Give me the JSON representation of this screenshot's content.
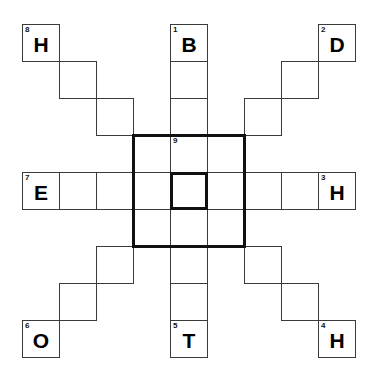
{
  "puzzle": {
    "title": "Crossword grid",
    "grid": {
      "rows": 9,
      "cols": 9,
      "cell_size": 37,
      "origin_x": 22,
      "origin_y": 24
    },
    "colors": {
      "background": "#ffffff",
      "thin_line": "#3a3a3a",
      "bold_line": "#111111",
      "letter": "#000000",
      "number": "#111111"
    },
    "cells": [
      {
        "row": 0,
        "col": 0,
        "number": "8",
        "letter": "H",
        "bold": false
      },
      {
        "row": 0,
        "col": 4,
        "number": "1",
        "letter": "B",
        "bold": false
      },
      {
        "row": 0,
        "col": 8,
        "number": "2",
        "letter": "D",
        "bold": false
      },
      {
        "row": 1,
        "col": 1,
        "number": "",
        "letter": "",
        "bold": false
      },
      {
        "row": 1,
        "col": 4,
        "number": "",
        "letter": "",
        "bold": false
      },
      {
        "row": 1,
        "col": 7,
        "number": "",
        "letter": "",
        "bold": false
      },
      {
        "row": 2,
        "col": 2,
        "number": "",
        "letter": "",
        "bold": false
      },
      {
        "row": 2,
        "col": 4,
        "number": "",
        "letter": "",
        "bold": false
      },
      {
        "row": 2,
        "col": 6,
        "number": "",
        "letter": "",
        "bold": false
      },
      {
        "row": 3,
        "col": 3,
        "number": "",
        "letter": "",
        "bold": false
      },
      {
        "row": 3,
        "col": 4,
        "number": "9",
        "letter": "",
        "bold": false
      },
      {
        "row": 3,
        "col": 5,
        "number": "",
        "letter": "",
        "bold": false
      },
      {
        "row": 4,
        "col": 0,
        "number": "7",
        "letter": "E",
        "bold": false
      },
      {
        "row": 4,
        "col": 1,
        "number": "",
        "letter": "",
        "bold": false
      },
      {
        "row": 4,
        "col": 2,
        "number": "",
        "letter": "",
        "bold": false
      },
      {
        "row": 4,
        "col": 3,
        "number": "",
        "letter": "",
        "bold": false
      },
      {
        "row": 4,
        "col": 4,
        "number": "",
        "letter": "",
        "bold": true
      },
      {
        "row": 4,
        "col": 5,
        "number": "",
        "letter": "",
        "bold": false
      },
      {
        "row": 4,
        "col": 6,
        "number": "",
        "letter": "",
        "bold": false
      },
      {
        "row": 4,
        "col": 7,
        "number": "",
        "letter": "",
        "bold": false
      },
      {
        "row": 4,
        "col": 8,
        "number": "3",
        "letter": "H",
        "bold": false
      },
      {
        "row": 5,
        "col": 3,
        "number": "",
        "letter": "",
        "bold": false
      },
      {
        "row": 5,
        "col": 4,
        "number": "",
        "letter": "",
        "bold": false
      },
      {
        "row": 5,
        "col": 5,
        "number": "",
        "letter": "",
        "bold": false
      },
      {
        "row": 6,
        "col": 2,
        "number": "",
        "letter": "",
        "bold": false
      },
      {
        "row": 6,
        "col": 4,
        "number": "",
        "letter": "",
        "bold": false
      },
      {
        "row": 6,
        "col": 6,
        "number": "",
        "letter": "",
        "bold": false
      },
      {
        "row": 7,
        "col": 1,
        "number": "",
        "letter": "",
        "bold": false
      },
      {
        "row": 7,
        "col": 4,
        "number": "",
        "letter": "",
        "bold": false
      },
      {
        "row": 7,
        "col": 7,
        "number": "",
        "letter": "",
        "bold": false
      },
      {
        "row": 8,
        "col": 0,
        "number": "6",
        "letter": "O",
        "bold": false
      },
      {
        "row": 8,
        "col": 4,
        "number": "5",
        "letter": "T",
        "bold": false
      },
      {
        "row": 8,
        "col": 8,
        "number": "4",
        "letter": "H",
        "bold": false
      }
    ],
    "bold_region": {
      "row": 3,
      "col": 3,
      "rows": 3,
      "cols": 3
    },
    "entry_numbers": [
      "1",
      "2",
      "3",
      "4",
      "5",
      "6",
      "7",
      "8",
      "9"
    ],
    "entry_letters": [
      "B",
      "D",
      "H",
      "H",
      "T",
      "O",
      "E",
      "H"
    ]
  }
}
